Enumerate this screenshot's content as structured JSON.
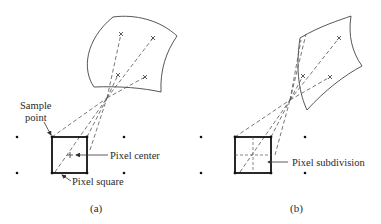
{
  "figure": {
    "panels": [
      {
        "id": "a",
        "caption": "(a)",
        "labels": {
          "sample_point_line1": "Sample",
          "sample_point_line2": "point",
          "pixel_center": "Pixel center",
          "pixel_square": "Pixel square"
        }
      },
      {
        "id": "b",
        "caption": "(b)",
        "labels": {
          "pixel_subdivision": "Pixel subdivision"
        }
      }
    ]
  }
}
